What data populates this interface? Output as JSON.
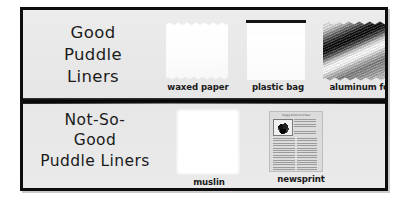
{
  "poster": {
    "title_good": {
      "lines": [
        "Good",
        "Puddle",
        "Liners"
      ]
    },
    "title_not_so_good": {
      "lines": [
        "Not-So-",
        "Good",
        "Puddle Liners"
      ]
    },
    "good_samples": [
      {
        "label": "waxed paper",
        "icon": "waxed-paper-swatch"
      },
      {
        "label": "plastic bag",
        "icon": "plastic-bag-swatch"
      },
      {
        "label": "aluminum foil",
        "icon": "aluminum-foil-swatch"
      }
    ],
    "bad_samples": [
      {
        "label": "muslin",
        "icon": "muslin-swatch"
      },
      {
        "label": "newsprint",
        "icon": "newsprint-swatch"
      }
    ],
    "newsprint_thumbnail": {
      "headline": "Froggy Pond Full of Rain"
    },
    "colors": {
      "background": "#e9e9e9",
      "border": "#0d0d0d",
      "divider": "#000000",
      "text": "#1b1b1b",
      "page": "#ffffff"
    }
  }
}
